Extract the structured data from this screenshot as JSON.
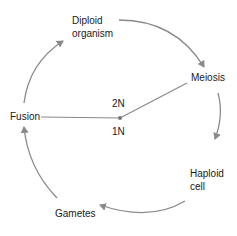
{
  "diagram": {
    "type": "life-cycle",
    "stages": [
      {
        "id": "diploid",
        "line1": "Diploid",
        "line2": "organism"
      },
      {
        "id": "meiosis",
        "line1": "Meiosis"
      },
      {
        "id": "haploid",
        "line1": "Haploid",
        "line2": "cell"
      },
      {
        "id": "gametes",
        "line1": "Gametes"
      },
      {
        "id": "fusion",
        "line1": "Fusion"
      }
    ],
    "center": {
      "upper": "2N",
      "lower": "1N"
    },
    "colors": {
      "arrow": "#8a8a8a",
      "text": "#1a1a1a",
      "line": "#8a8a8a"
    }
  }
}
